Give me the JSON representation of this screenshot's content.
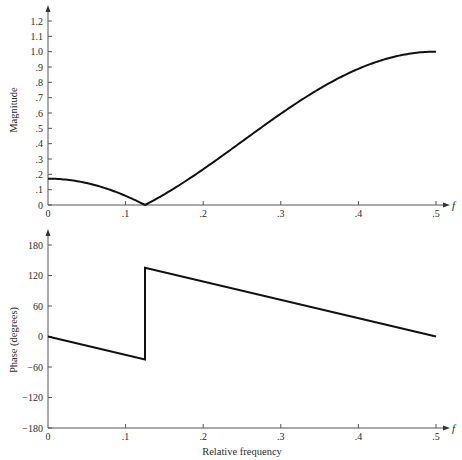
{
  "chart_data": [
    {
      "type": "line",
      "title": "",
      "xlabel": "f",
      "ylabel": "Magnitude",
      "xlim": [
        0,
        0.5
      ],
      "ylim": [
        0,
        1.2
      ],
      "grid": false,
      "x_ticks": [
        0,
        0.1,
        0.2,
        0.3,
        0.4,
        0.5
      ],
      "x_tick_labels": [
        "0",
        ".1",
        ".2",
        ".3",
        ".4",
        ".5"
      ],
      "y_ticks": [
        0,
        0.1,
        0.2,
        0.3,
        0.4,
        0.5,
        0.6,
        0.7,
        0.8,
        0.9,
        1.0,
        1.1,
        1.2
      ],
      "y_tick_labels": [
        "0",
        ".1",
        ".2",
        ".3",
        ".4",
        ".5",
        ".6",
        ".7",
        ".8",
        ".9",
        "1.0",
        "1.1",
        "1.2"
      ],
      "series": [
        {
          "name": "Magnitude",
          "x": [
            0,
            0.025,
            0.05,
            0.075,
            0.1,
            0.125,
            0.15,
            0.175,
            0.2,
            0.225,
            0.25,
            0.275,
            0.3,
            0.325,
            0.35,
            0.375,
            0.4,
            0.425,
            0.45,
            0.475,
            0.5
          ],
          "values": [
            0.172,
            0.157,
            0.143,
            0.098,
            0.06,
            0.0,
            0.07,
            0.148,
            0.233,
            0.32,
            0.414,
            0.508,
            0.595,
            0.68,
            0.758,
            0.828,
            0.888,
            0.935,
            0.971,
            0.993,
            1.0
          ]
        }
      ]
    },
    {
      "type": "line",
      "title": "",
      "xlabel": "Relative frequency",
      "ylabel": "Phase (degrees)",
      "xlim": [
        0,
        0.5
      ],
      "ylim": [
        -180,
        180
      ],
      "grid": false,
      "x_ticks": [
        0,
        0.1,
        0.2,
        0.3,
        0.4,
        0.5
      ],
      "x_tick_labels": [
        "0",
        ".1",
        ".2",
        ".3",
        ".4",
        ".5"
      ],
      "y_ticks": [
        -180,
        -120,
        -60,
        0,
        60,
        120,
        180
      ],
      "y_tick_labels": [
        "-180",
        "-120",
        "-60",
        "0",
        "60",
        "120",
        "180"
      ],
      "series": [
        {
          "name": "Phase",
          "x": [
            0,
            0.125,
            0.125,
            0.5
          ],
          "values": [
            0,
            -45,
            135,
            0
          ]
        }
      ]
    }
  ],
  "labels": {
    "top_ylabel": "Magnitude",
    "bottom_ylabel": "Phase (degrees)",
    "top_xaxis_symbol": "f",
    "bottom_xaxis_symbol": "f",
    "bottom_xlabel": "Relative frequency"
  }
}
